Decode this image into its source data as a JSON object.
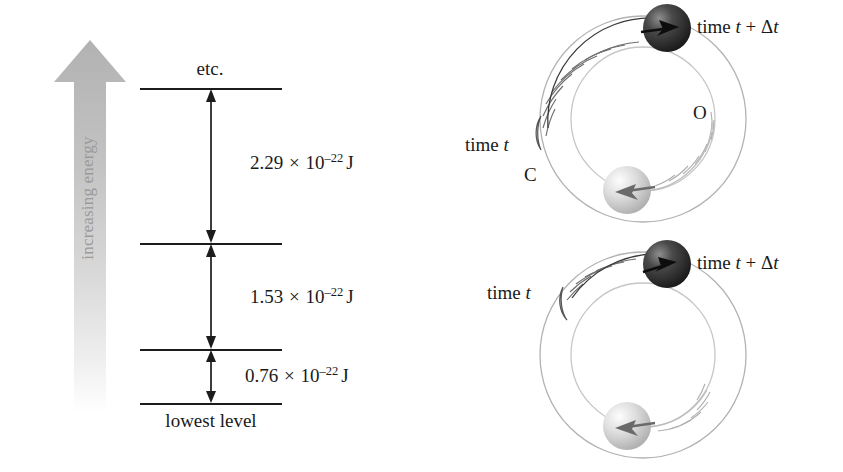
{
  "figure": {
    "background_color": "#ffffff",
    "ink_color": "#1a1a1a"
  },
  "energy_diagram": {
    "axis": {
      "label": "increasing energy",
      "color": "#9a9a9a",
      "direction": "up"
    },
    "top_caption": "etc.",
    "bottom_caption": "lowest level",
    "levels": [
      {
        "name": "etc-level",
        "y": 88
      },
      {
        "name": "third-level",
        "y": 243
      },
      {
        "name": "second-level",
        "y": 349
      },
      {
        "name": "lowest-level",
        "y": 403
      }
    ],
    "gaps": [
      {
        "name": "gap-upper",
        "mantissa": "2.29",
        "times": "×",
        "base": "10",
        "exponent": "–22",
        "unit": "J",
        "label": "2.29 × 10⁻²² J"
      },
      {
        "name": "gap-middle",
        "mantissa": "1.53",
        "times": "×",
        "base": "10",
        "exponent": "–22",
        "unit": "J",
        "label": "1.53 × 10⁻²² J"
      },
      {
        "name": "gap-lower",
        "mantissa": "0.76",
        "times": "×",
        "base": "10",
        "exponent": "–22",
        "unit": "J",
        "label": "0.76 × 10⁻²² J"
      }
    ]
  },
  "molecule_diagrams": [
    {
      "name": "fast-rotation",
      "time_initial_label": "time t",
      "time_final_label": "time t + Δt",
      "carbon_label": "C",
      "oxygen_label": "O",
      "dark_atom_color": "#2b2b2b",
      "light_atom_color": "#cfcfcf",
      "orbit_color": "#b9b9b9"
    },
    {
      "name": "slow-rotation",
      "time_initial_label": "time t",
      "time_final_label": "time t + Δt",
      "carbon_label": "",
      "oxygen_label": "",
      "dark_atom_color": "#2b2b2b",
      "light_atom_color": "#cfcfcf",
      "orbit_color": "#b9b9b9"
    }
  ]
}
